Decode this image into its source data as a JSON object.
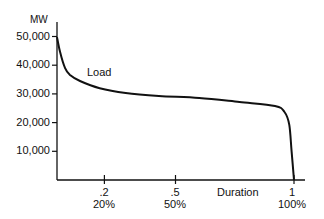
{
  "chart_data": {
    "type": "line",
    "title": "",
    "xlabel": "Duration",
    "ylabel": "MW",
    "xlim": [
      0,
      1
    ],
    "ylim": [
      0,
      50000
    ],
    "grid": false,
    "legend": null,
    "y_ticks": [
      {
        "value": 50000,
        "label": "50,000"
      },
      {
        "value": 40000,
        "label": "40,000"
      },
      {
        "value": 30000,
        "label": "30,000"
      },
      {
        "value": 20000,
        "label": "20,000"
      },
      {
        "value": 10000,
        "label": "10,000"
      }
    ],
    "x_ticks": [
      {
        "value": 0.2,
        "label": ".2",
        "sublabel": "20%"
      },
      {
        "value": 0.5,
        "label": ".5",
        "sublabel": "50%"
      },
      {
        "value": 1.0,
        "label": "1",
        "sublabel": "100%"
      }
    ],
    "annotations": [
      {
        "text": "Load",
        "x": 0.12,
        "y": 38000
      }
    ],
    "series": [
      {
        "name": "Load",
        "color": "#111111",
        "x": [
          0.0,
          0.013,
          0.034,
          0.055,
          0.097,
          0.18,
          0.29,
          0.43,
          0.6,
          0.77,
          0.92,
          0.96,
          0.98,
          0.99,
          1.0
        ],
        "y": [
          49800,
          44600,
          39000,
          36600,
          34500,
          32000,
          30300,
          29300,
          28600,
          27200,
          25800,
          23700,
          19200,
          10000,
          0
        ]
      }
    ]
  }
}
